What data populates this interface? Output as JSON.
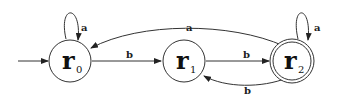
{
  "diagram": {
    "type": "finite-automaton",
    "states": [
      {
        "id": "r0",
        "name": "r",
        "sub": "0",
        "start": true,
        "accept": false
      },
      {
        "id": "r1",
        "name": "r",
        "sub": "1",
        "start": false,
        "accept": false
      },
      {
        "id": "r2",
        "name": "r",
        "sub": "2",
        "start": false,
        "accept": true
      }
    ],
    "transitions": [
      {
        "from": "r0",
        "to": "r0",
        "label": "a"
      },
      {
        "from": "r0",
        "to": "r1",
        "label": "b"
      },
      {
        "from": "r1",
        "to": "r2",
        "label": "b"
      },
      {
        "from": "r2",
        "to": "r2",
        "label": "a"
      },
      {
        "from": "r2",
        "to": "r0",
        "label": "a"
      },
      {
        "from": "r2",
        "to": "r1",
        "label": "b"
      }
    ]
  }
}
